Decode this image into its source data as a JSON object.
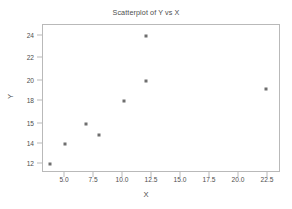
{
  "chart_data": {
    "type": "scatter",
    "title": "Scatterplot of Y vs X",
    "xlabel": "X",
    "ylabel": "Y",
    "grid": false,
    "legend": null,
    "xlim": [
      3.0,
      23.3
    ],
    "ylim": [
      11.3,
      24.6
    ],
    "xticks": [
      "5.0",
      "7.5",
      "10.0",
      "12.5",
      "15.0",
      "17.5",
      "20.0",
      "22.5"
    ],
    "xtick_values": [
      5.0,
      7.5,
      10.0,
      12.5,
      15.0,
      17.5,
      20.0,
      22.5
    ],
    "yticks": [
      "12",
      "14",
      "15",
      "18",
      "20",
      "22",
      "24"
    ],
    "ytick_values": [
      12,
      14,
      15,
      18,
      20,
      22,
      24
    ],
    "ytick_positions_px": [
      163,
      143,
      123,
      100,
      80,
      57,
      35
    ],
    "marker": "square",
    "marker_color": "#6e6e6e",
    "marker_size_px": 3,
    "frame_color": "#b9b9b9",
    "text_color": "#4d4d4d",
    "points": [
      {
        "x": 4,
        "y": 12,
        "px": 49,
        "py": 163
      },
      {
        "x": 5,
        "y": 14,
        "px": 64,
        "py": 143
      },
      {
        "x": 7,
        "y": 15,
        "px": 85,
        "py": 123
      },
      {
        "x": 8,
        "y": 14.5,
        "px": 98,
        "py": 134
      },
      {
        "x": 10,
        "y": 18,
        "px": 123,
        "py": 100
      },
      {
        "x": 12,
        "y": 20,
        "px": 145,
        "py": 80
      },
      {
        "x": 12,
        "y": 24,
        "px": 145,
        "py": 35
      },
      {
        "x": 22,
        "y": 19,
        "px": 265,
        "py": 88
      }
    ],
    "xtick_positions_px": [
      64,
      93,
      122,
      151,
      180,
      209,
      238,
      267
    ]
  }
}
